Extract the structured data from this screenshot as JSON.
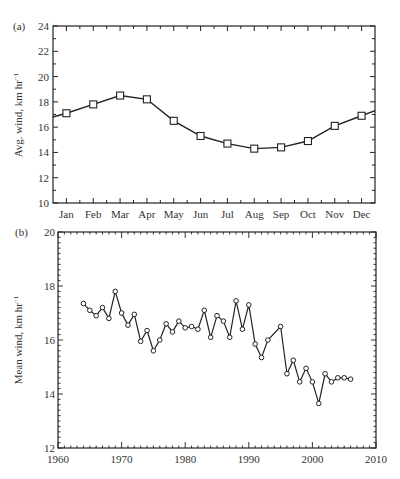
{
  "chart_data": [
    {
      "panel": "(a)",
      "type": "line",
      "title": "",
      "xlabel": "",
      "ylabel": "Avg. wind, km hr⁻¹",
      "categories": [
        "Jan",
        "Feb",
        "Mar",
        "Apr",
        "May",
        "Jun",
        "Jul",
        "Aug",
        "Sep",
        "Oct",
        "Nov",
        "Dec"
      ],
      "values": [
        17.1,
        17.8,
        18.5,
        18.2,
        16.5,
        15.3,
        14.7,
        14.3,
        14.4,
        14.9,
        16.1,
        16.9
      ],
      "edge_values": {
        "left": 16.8,
        "right": 17.3
      },
      "ylim": [
        10,
        24
      ],
      "yticks": [
        10,
        12,
        14,
        16,
        18,
        20,
        22,
        24
      ],
      "marker": "square",
      "grid": false,
      "legend": null
    },
    {
      "panel": "(b)",
      "type": "line",
      "title": "",
      "xlabel": "",
      "ylabel": "Mean wind, km hr⁻¹",
      "x": [
        1964,
        1965,
        1966,
        1967,
        1968,
        1969,
        1970,
        1971,
        1972,
        1973,
        1974,
        1975,
        1976,
        1977,
        1978,
        1979,
        1980,
        1981,
        1982,
        1983,
        1984,
        1985,
        1986,
        1987,
        1988,
        1989,
        1990,
        1991,
        1992,
        1993,
        1995,
        1996,
        1997,
        1998,
        1999,
        2000,
        2001,
        2002,
        2003,
        2004,
        2005,
        2006
      ],
      "values": [
        17.35,
        17.1,
        16.9,
        17.2,
        16.8,
        17.8,
        17.0,
        16.55,
        16.95,
        15.95,
        16.35,
        15.6,
        16.0,
        16.6,
        16.3,
        16.7,
        16.45,
        16.5,
        16.4,
        17.1,
        16.1,
        16.9,
        16.7,
        16.1,
        17.45,
        16.4,
        17.3,
        15.85,
        15.35,
        16.0,
        16.5,
        14.75,
        15.25,
        14.45,
        14.95,
        14.45,
        13.65,
        14.75,
        14.45,
        14.6,
        14.6,
        14.55
      ],
      "xlim": [
        1960,
        2010
      ],
      "xticks": [
        1960,
        1970,
        1980,
        1990,
        2000,
        2010
      ],
      "ylim": [
        12,
        20
      ],
      "yticks": [
        12,
        14,
        16,
        18,
        20
      ],
      "marker": "circle",
      "grid": false,
      "legend": null
    }
  ],
  "panels": {
    "a": {
      "label": "(a)",
      "ylabel": "Avg. wind, km hr",
      "ylabel_sup": "−1",
      "yticks": [
        "10",
        "12",
        "14",
        "16",
        "18",
        "20",
        "22",
        "24"
      ],
      "xticks": [
        "Jan",
        "Feb",
        "Mar",
        "Apr",
        "May",
        "Jun",
        "Jul",
        "Aug",
        "Sep",
        "Oct",
        "Nov",
        "Dec"
      ]
    },
    "b": {
      "label": "(b)",
      "ylabel": "Mean wind, km hr",
      "ylabel_sup": "−1",
      "yticks": [
        "12",
        "14",
        "16",
        "18",
        "20"
      ],
      "xticks": [
        "1960",
        "1970",
        "1980",
        "1990",
        "2000",
        "2010"
      ]
    }
  }
}
